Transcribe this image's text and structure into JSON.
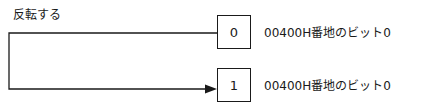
{
  "diagram": {
    "operation_label": "反転する",
    "before": {
      "bit_value": "0",
      "description": "00400H番地のビット0"
    },
    "after": {
      "bit_value": "1",
      "description": "00400H番地のビット0"
    },
    "colors": {
      "line": "#1a1a1a",
      "background": "#ffffff"
    }
  }
}
